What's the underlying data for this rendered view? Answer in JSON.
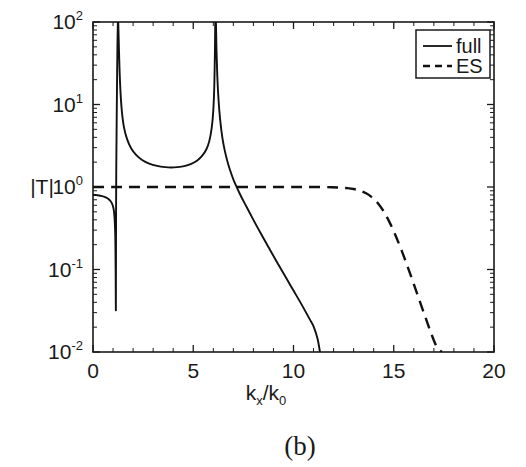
{
  "caption": "(b)",
  "chart_data": {
    "type": "line",
    "title": "",
    "subtitle": "",
    "xlabel": "k_x/k_0",
    "xlabel_parts": {
      "base1": "k",
      "sub1": "x",
      "slash": "/",
      "base2": "k",
      "sub2": "0"
    },
    "ylabel": "|T|",
    "xlim": [
      0,
      20
    ],
    "ylim": [
      0.01,
      100
    ],
    "yscale": "log",
    "xscale": "linear",
    "grid": false,
    "xticks": [
      0,
      5,
      10,
      15,
      20
    ],
    "xticklabels": [
      "0",
      "5",
      "10",
      "15",
      "20"
    ],
    "yticks": [
      0.01,
      0.1,
      1,
      10,
      100
    ],
    "yticklabels": [
      "10-2",
      "10-1",
      "100",
      "101",
      "102"
    ],
    "ytick_mantissa": "10",
    "ytick_exponents": [
      "-2",
      "-1",
      "0",
      "1",
      "2"
    ],
    "legend_position": "upper right",
    "legend": [
      {
        "name": "full",
        "style": "solid"
      },
      {
        "name": "ES",
        "style": "dashed"
      }
    ],
    "series": [
      {
        "name": "full",
        "style": "solid",
        "description": "Full transmission magnitude: starts at 0.8, sharp zero dip near kx/k0=1.15, pole near 1.25, broad minimum 1.7 near 3.8, second pole near 6.1, then monotonic decay off-scale at 11.3",
        "points": [
          [
            0.0,
            0.8
          ],
          [
            0.1,
            0.8
          ],
          [
            0.2,
            0.795
          ],
          [
            0.3,
            0.79
          ],
          [
            0.4,
            0.782
          ],
          [
            0.5,
            0.77
          ],
          [
            0.6,
            0.755
          ],
          [
            0.7,
            0.735
          ],
          [
            0.8,
            0.705
          ],
          [
            0.88,
            0.672
          ],
          [
            0.95,
            0.63
          ],
          [
            1.0,
            0.58
          ],
          [
            1.04,
            0.52
          ],
          [
            1.07,
            0.44
          ],
          [
            1.09,
            0.36
          ],
          [
            1.11,
            0.26
          ],
          [
            1.12,
            0.17
          ],
          [
            1.13,
            0.085
          ],
          [
            1.14,
            0.032
          ],
          [
            1.145,
            0.1
          ],
          [
            1.15,
            0.4
          ],
          [
            1.16,
            1.6
          ],
          [
            1.18,
            6.0
          ],
          [
            1.2,
            20.0
          ],
          [
            1.22,
            55.0
          ],
          [
            1.24,
            100.0
          ],
          [
            1.26,
            100.0
          ],
          [
            1.29,
            52.0
          ],
          [
            1.33,
            24.0
          ],
          [
            1.38,
            13.0
          ],
          [
            1.45,
            7.8
          ],
          [
            1.55,
            5.2
          ],
          [
            1.7,
            3.8
          ],
          [
            1.9,
            2.95
          ],
          [
            2.15,
            2.45
          ],
          [
            2.45,
            2.12
          ],
          [
            2.8,
            1.92
          ],
          [
            3.2,
            1.8
          ],
          [
            3.6,
            1.74
          ],
          [
            3.9,
            1.725
          ],
          [
            4.2,
            1.74
          ],
          [
            4.55,
            1.79
          ],
          [
            4.9,
            1.91
          ],
          [
            5.2,
            2.1
          ],
          [
            5.45,
            2.4
          ],
          [
            5.65,
            2.85
          ],
          [
            5.8,
            3.6
          ],
          [
            5.92,
            5.2
          ],
          [
            6.0,
            8.5
          ],
          [
            6.05,
            17.0
          ],
          [
            6.08,
            42.0
          ],
          [
            6.1,
            100.0
          ],
          [
            6.13,
            100.0
          ],
          [
            6.16,
            45.0
          ],
          [
            6.2,
            22.0
          ],
          [
            6.26,
            11.5
          ],
          [
            6.34,
            6.6
          ],
          [
            6.45,
            4.0
          ],
          [
            6.58,
            2.7
          ],
          [
            6.75,
            1.86
          ],
          [
            6.95,
            1.33
          ],
          [
            7.1,
            1.08
          ],
          [
            7.35,
            0.8
          ],
          [
            7.65,
            0.58
          ],
          [
            8.0,
            0.4
          ],
          [
            8.4,
            0.265
          ],
          [
            8.8,
            0.178
          ],
          [
            9.2,
            0.12
          ],
          [
            9.6,
            0.0815
          ],
          [
            10.0,
            0.0555
          ],
          [
            10.4,
            0.0378
          ],
          [
            10.8,
            0.0252
          ],
          [
            11.0,
            0.0205
          ],
          [
            11.2,
            0.0145
          ],
          [
            11.32,
            0.01
          ]
        ]
      },
      {
        "name": "ES",
        "style": "dashed",
        "description": "Electrostatic approximation: flat unity transmission out to kx/k0 about 12.5, then rolls off reaching 0.01 at 17.4",
        "points": [
          [
            0.0,
            1.0
          ],
          [
            1.0,
            1.0
          ],
          [
            2.0,
            1.0
          ],
          [
            3.0,
            1.0
          ],
          [
            4.0,
            1.0
          ],
          [
            5.0,
            1.0
          ],
          [
            6.0,
            1.0
          ],
          [
            7.0,
            1.0
          ],
          [
            8.0,
            1.0
          ],
          [
            9.0,
            1.0
          ],
          [
            10.0,
            1.0
          ],
          [
            10.8,
            1.0
          ],
          [
            11.4,
            0.998
          ],
          [
            11.9,
            0.993
          ],
          [
            12.3,
            0.985
          ],
          [
            12.7,
            0.968
          ],
          [
            13.0,
            0.945
          ],
          [
            13.3,
            0.905
          ],
          [
            13.6,
            0.845
          ],
          [
            13.9,
            0.755
          ],
          [
            14.2,
            0.64
          ],
          [
            14.5,
            0.505
          ],
          [
            14.8,
            0.37
          ],
          [
            15.1,
            0.255
          ],
          [
            15.4,
            0.168
          ],
          [
            15.7,
            0.107
          ],
          [
            16.0,
            0.0665
          ],
          [
            16.3,
            0.041
          ],
          [
            16.6,
            0.0255
          ],
          [
            16.9,
            0.016
          ],
          [
            17.15,
            0.0115
          ],
          [
            17.4,
            0.01
          ]
        ]
      }
    ]
  }
}
